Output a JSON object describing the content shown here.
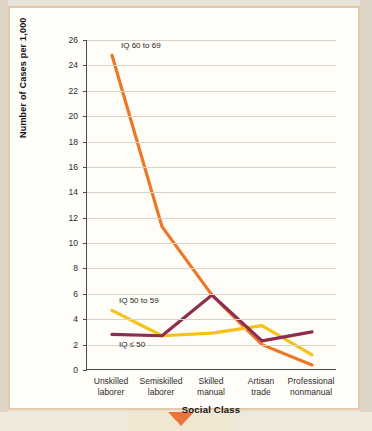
{
  "chart_data": {
    "type": "line",
    "title": "",
    "xlabel": "Social Class",
    "ylabel": "Number of Cases per 1,000",
    "categories": [
      "Unskilled laborer",
      "Semiskilled laborer",
      "Skilled manual",
      "Artisan trade",
      "Professional nonmanual"
    ],
    "category_lines": [
      [
        "Unskilled",
        "laborer"
      ],
      [
        "Semiskilled",
        "laborer"
      ],
      [
        "Skilled",
        "manual"
      ],
      [
        "Artisan",
        "trade"
      ],
      [
        "Professional",
        "nonmanual"
      ]
    ],
    "ylim": [
      0,
      26
    ],
    "yticks": [
      0,
      2,
      4,
      6,
      8,
      10,
      12,
      14,
      16,
      18,
      20,
      22,
      24,
      26
    ],
    "ytick_labels": [
      "0",
      "2",
      "4",
      "6",
      "8",
      "10",
      "12",
      "14",
      "16",
      "18",
      "20",
      "22",
      "24",
      "26"
    ],
    "grid": true,
    "legend_position": "inline-annotations",
    "series": [
      {
        "name": "IQ 60 to 69",
        "color": "#ec7825",
        "values": [
          24.8,
          11.3,
          5.9,
          2.0,
          0.4
        ]
      },
      {
        "name": "IQ 50 to 59",
        "color": "#f5c21a",
        "values": [
          4.7,
          2.7,
          2.9,
          3.5,
          1.2
        ]
      },
      {
        "name": "IQ ≤ 50",
        "color": "#8e2c52",
        "values": [
          2.8,
          2.7,
          5.9,
          2.3,
          3.0
        ]
      }
    ],
    "annotations": [
      {
        "text": "IQ 60 to 69",
        "for_series": "IQ 60 to 69"
      },
      {
        "text": "IQ 50 to 59",
        "for_series": "IQ 50 to 59"
      },
      {
        "text": "IQ ≤ 50",
        "for_series": "IQ ≤ 50"
      }
    ]
  }
}
